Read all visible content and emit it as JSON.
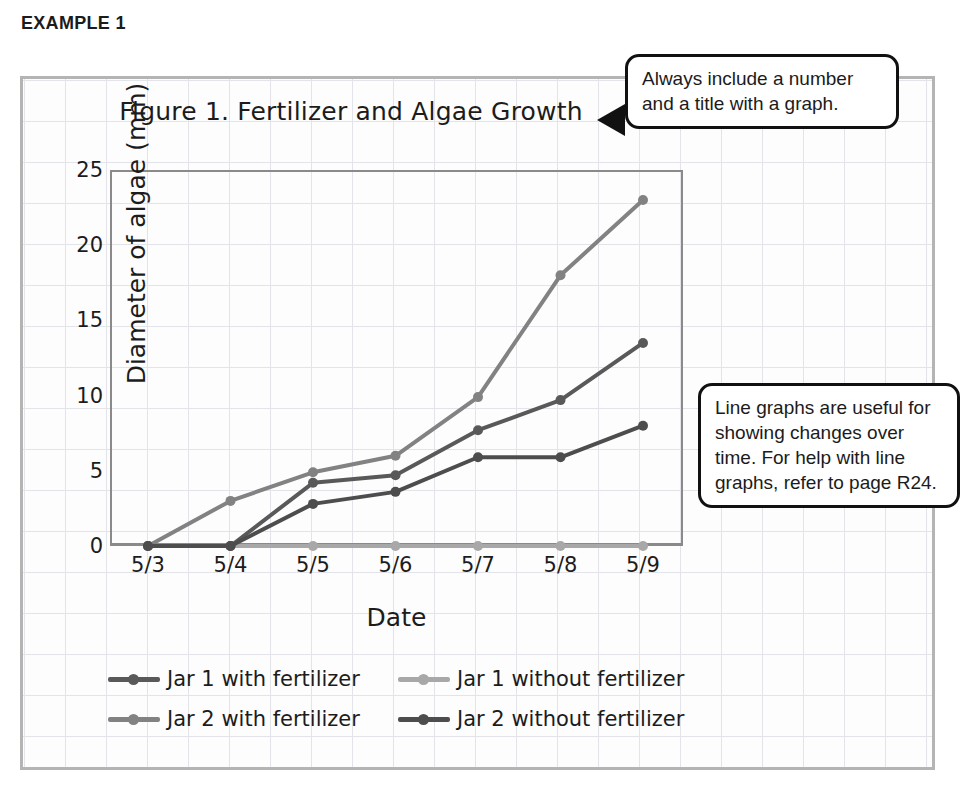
{
  "example_heading": "EXAMPLE 1",
  "chart_data": {
    "type": "line",
    "title": "Figure 1. Fertilizer and Algae Growth",
    "xlabel": "Date",
    "ylabel": "Diameter of algae (mm)",
    "categories": [
      "5/3",
      "5/4",
      "5/5",
      "5/6",
      "5/7",
      "5/8",
      "5/9"
    ],
    "ylim": [
      0,
      25
    ],
    "yticks": [
      0,
      5,
      10,
      15,
      20,
      25
    ],
    "grid": true,
    "legend_position": "below",
    "series": [
      {
        "name": "Jar 1 with fertilizer",
        "color": "#595959",
        "values": [
          0,
          0,
          4.2,
          4.7,
          7.7,
          9.7,
          13.5
        ]
      },
      {
        "name": "Jar 1 without fertilizer",
        "color": "#a8a8a8",
        "values": [
          0,
          0,
          0,
          0,
          0,
          0,
          0
        ]
      },
      {
        "name": "Jar 2 with fertilizer",
        "color": "#828282",
        "values": [
          0,
          3.0,
          4.9,
          6.0,
          9.9,
          18.0,
          23.0
        ]
      },
      {
        "name": "Jar 2 without fertilizer",
        "color": "#4d4d4d",
        "values": [
          0,
          0,
          2.8,
          3.6,
          5.9,
          5.9,
          8.0
        ]
      }
    ]
  },
  "callouts": [
    {
      "id": "title-callout",
      "text": "Always include a number and a title with a graph."
    },
    {
      "id": "usage-callout",
      "text": "Line graphs are useful for showing changes over time. For help with line graphs, refer to page R24."
    }
  ]
}
